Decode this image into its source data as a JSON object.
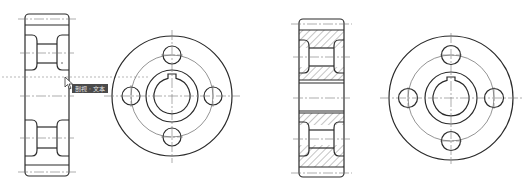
{
  "drawing": {
    "type": "engineering-drawing",
    "views": [
      {
        "name": "side-view-left",
        "style": "outline"
      },
      {
        "name": "front-view-left",
        "holes": 4,
        "keyway": true
      },
      {
        "name": "section-view-right",
        "style": "hatched"
      },
      {
        "name": "front-view-right",
        "holes": 4,
        "keyway": true
      }
    ],
    "colors": {
      "line": "#2a2a2a",
      "centerline": "#777777",
      "tooltip_bg": "#4a4a4a",
      "tooltip_fg": "#e8e8e8"
    }
  },
  "tooltip": {
    "label": "剖视 · 文本"
  },
  "cursor": {
    "icon": "arrow-pointer"
  }
}
